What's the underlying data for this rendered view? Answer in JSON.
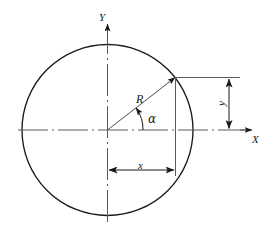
{
  "figure": {
    "type": "geometry-diagram",
    "colors": {
      "stroke": "#1a1a1a",
      "axis": "#4d4d4d",
      "background": "#ffffff"
    },
    "labels": {
      "axis_y": "Y",
      "axis_x": "X",
      "radius": "R",
      "angle": "α",
      "abscissa": "x",
      "ordinate": "y"
    },
    "geometry": {
      "center": {
        "x": 107.5,
        "y": 130
      },
      "radius_px": 85.5,
      "point_on_circle": {
        "x": 175,
        "y": 77.5
      },
      "angle_deg": 38,
      "x_dimension": {
        "from": 107.5,
        "to": 175.5,
        "y": 170
      },
      "y_dimension": {
        "x": 229,
        "from": 77.5,
        "to": 130
      }
    }
  }
}
